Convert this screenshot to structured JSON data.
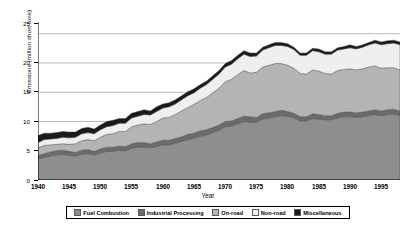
{
  "chart_data": {
    "type": "area",
    "stacked": true,
    "title": "",
    "xlabel": "Year",
    "ylabel": "Emissions (million short tons)",
    "xlim": [
      1940,
      1998
    ],
    "ylim": [
      0,
      27
    ],
    "yticks": [
      0,
      5,
      10,
      15,
      20,
      25
    ],
    "xticks": [
      1940,
      1945,
      1950,
      1955,
      1960,
      1965,
      1970,
      1975,
      1980,
      1985,
      1990,
      1995
    ],
    "grid": "horizontal",
    "legend_position": "below",
    "minor_xticks": "every 1 year",
    "x": [
      1940,
      1941,
      1942,
      1943,
      1944,
      1945,
      1946,
      1947,
      1948,
      1949,
      1950,
      1951,
      1952,
      1953,
      1954,
      1955,
      1956,
      1957,
      1958,
      1959,
      1960,
      1961,
      1962,
      1963,
      1964,
      1965,
      1966,
      1967,
      1968,
      1969,
      1970,
      1971,
      1972,
      1973,
      1974,
      1975,
      1976,
      1977,
      1978,
      1979,
      1980,
      1981,
      1982,
      1983,
      1984,
      1985,
      1986,
      1987,
      1988,
      1989,
      1990,
      1991,
      1992,
      1993,
      1994,
      1995,
      1996,
      1997,
      1998
    ],
    "series": [
      {
        "name": "Fuel Combustion",
        "color": "#8e8e8e",
        "values": [
          3.6,
          3.9,
          4.1,
          4.3,
          4.4,
          4.2,
          4.1,
          4.4,
          4.5,
          4.3,
          4.6,
          4.9,
          4.9,
          5.1,
          5.0,
          5.4,
          5.6,
          5.6,
          5.5,
          5.7,
          6.0,
          6.0,
          6.3,
          6.6,
          6.9,
          7.1,
          7.5,
          7.7,
          8.1,
          8.5,
          9.1,
          9.2,
          9.6,
          10.0,
          9.9,
          9.9,
          10.4,
          10.6,
          10.8,
          11.0,
          10.9,
          10.6,
          10.1,
          10.1,
          10.5,
          10.4,
          10.3,
          10.3,
          10.6,
          10.8,
          10.8,
          10.7,
          10.8,
          11.0,
          11.2,
          11.0,
          11.2,
          11.3,
          11.0
        ]
      },
      {
        "name": "Industrial Processing",
        "color": "#6b6b6b",
        "values": [
          0.6,
          0.6,
          0.7,
          0.7,
          0.7,
          0.7,
          0.6,
          0.7,
          0.7,
          0.6,
          0.7,
          0.7,
          0.7,
          0.7,
          0.7,
          0.8,
          0.8,
          0.8,
          0.7,
          0.8,
          0.8,
          0.8,
          0.8,
          0.8,
          0.9,
          0.9,
          0.9,
          0.9,
          0.9,
          0.9,
          0.9,
          0.9,
          0.9,
          0.9,
          0.9,
          0.8,
          0.9,
          0.9,
          0.9,
          0.9,
          0.8,
          0.8,
          0.7,
          0.7,
          0.8,
          0.8,
          0.7,
          0.7,
          0.8,
          0.8,
          0.8,
          0.8,
          0.8,
          0.8,
          0.8,
          0.8,
          0.8,
          0.8,
          0.8
        ]
      },
      {
        "name": "On-road",
        "color": "#b4b4b4",
        "values": [
          1.3,
          1.4,
          1.2,
          1.1,
          1.1,
          1.2,
          1.5,
          1.6,
          1.7,
          1.8,
          2.0,
          2.2,
          2.3,
          2.5,
          2.6,
          2.9,
          3.0,
          3.2,
          3.3,
          3.5,
          3.8,
          3.9,
          4.1,
          4.4,
          4.6,
          4.9,
          5.2,
          5.5,
          5.9,
          6.3,
          6.8,
          7.1,
          7.5,
          7.8,
          7.5,
          7.7,
          8.0,
          8.1,
          8.2,
          8.0,
          7.9,
          7.7,
          7.4,
          7.3,
          7.5,
          7.4,
          7.2,
          7.1,
          7.3,
          7.3,
          7.4,
          7.3,
          7.4,
          7.5,
          7.5,
          7.3,
          7.2,
          7.1,
          7.0
        ]
      },
      {
        "name": "Non-road",
        "color": "#efefef",
        "values": [
          0.9,
          1.0,
          1.0,
          1.0,
          1.1,
          1.1,
          1.1,
          1.2,
          1.2,
          1.2,
          1.3,
          1.3,
          1.4,
          1.4,
          1.4,
          1.5,
          1.5,
          1.6,
          1.6,
          1.7,
          1.7,
          1.8,
          1.8,
          1.9,
          2.0,
          2.0,
          2.1,
          2.2,
          2.3,
          2.4,
          2.5,
          2.6,
          2.7,
          2.8,
          2.8,
          2.8,
          2.9,
          3.0,
          3.1,
          3.1,
          3.2,
          3.2,
          3.1,
          3.2,
          3.3,
          3.3,
          3.3,
          3.4,
          3.5,
          3.5,
          3.6,
          3.6,
          3.7,
          3.8,
          3.9,
          4.0,
          4.1,
          4.2,
          4.3
        ]
      },
      {
        "name": "Miscellaneous",
        "color": "#1a1a1a",
        "values": [
          1.2,
          1.1,
          1.0,
          1.0,
          1.0,
          1.0,
          0.9,
          0.9,
          0.9,
          0.8,
          0.8,
          0.9,
          0.9,
          0.8,
          0.8,
          0.8,
          0.8,
          0.8,
          0.7,
          0.8,
          0.7,
          0.7,
          0.7,
          0.7,
          0.7,
          0.7,
          0.6,
          0.6,
          0.6,
          0.6,
          0.6,
          0.6,
          0.6,
          0.6,
          0.6,
          0.5,
          0.5,
          0.5,
          0.5,
          0.5,
          0.5,
          0.4,
          0.4,
          0.4,
          0.4,
          0.5,
          0.4,
          0.4,
          0.4,
          0.4,
          0.5,
          0.4,
          0.4,
          0.4,
          0.5,
          0.5,
          0.5,
          0.5,
          0.5
        ]
      }
    ],
    "totals": [
      7.6,
      8.0,
      8.0,
      8.1,
      8.3,
      8.2,
      8.2,
      8.8,
      9.0,
      8.7,
      9.4,
      10.0,
      10.2,
      10.5,
      10.5,
      11.4,
      11.7,
      12.0,
      11.8,
      12.5,
      13.0,
      13.2,
      13.7,
      14.4,
      15.1,
      15.6,
      16.3,
      16.9,
      17.8,
      18.7,
      19.9,
      20.4,
      21.3,
      22.1,
      21.7,
      21.7,
      22.7,
      23.1,
      23.5,
      23.5,
      23.3,
      22.7,
      21.7,
      21.7,
      22.5,
      22.4,
      21.9,
      21.9,
      22.6,
      22.8,
      23.1,
      22.8,
      23.1,
      23.5,
      23.9,
      23.6,
      23.8,
      23.9,
      23.6
    ]
  },
  "axes": {
    "ylabel": "Emissions (million short tons)",
    "xlabel": "Year",
    "ytick_labels": [
      "0",
      "5",
      "10",
      "15",
      "20",
      "25"
    ],
    "xtick_labels": [
      "1940",
      "1945",
      "1950",
      "1955",
      "1960",
      "1965",
      "1970",
      "1975",
      "1980",
      "1985",
      "1990",
      "1995"
    ]
  },
  "legend": {
    "items": [
      {
        "label": "Fuel Combustion",
        "color": "#8e8e8e"
      },
      {
        "label": "Industrial Processing",
        "color": "#6b6b6b"
      },
      {
        "label": "On-road",
        "color": "#b4b4b4"
      },
      {
        "label": "Non-road",
        "color": "#efefef"
      },
      {
        "label": "Miscellaneous",
        "color": "#1a1a1a"
      }
    ]
  }
}
